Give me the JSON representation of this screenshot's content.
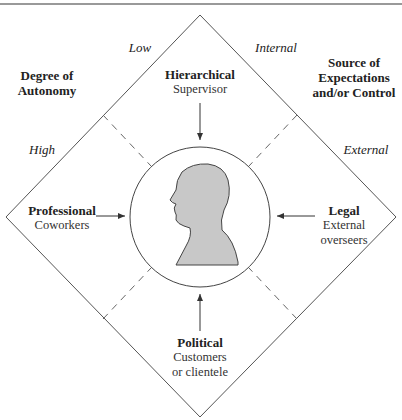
{
  "header": {
    "partial_title": ""
  },
  "axes": {
    "left_title_line1": "Degree of",
    "left_title_line2": "Autonomy",
    "right_title_line1": "Source of",
    "right_title_line2": "Expectations",
    "right_title_line3": "and/or Control",
    "low": "Low",
    "high": "High",
    "internal": "Internal",
    "external": "External"
  },
  "quadrants": {
    "top": {
      "title": "Hierarchical",
      "sub": "Supervisor"
    },
    "left": {
      "title": "Professional",
      "sub": "Coworkers"
    },
    "right": {
      "title": "Legal",
      "sub1": "External",
      "sub2": "overseers"
    },
    "bottom": {
      "title": "Political",
      "sub1": "Customers",
      "sub2": "or clientele"
    }
  },
  "colors": {
    "line": "#555555",
    "dash": "#666666",
    "silhouette": "#c8c8c8",
    "silhouette_stroke": "#444444"
  }
}
